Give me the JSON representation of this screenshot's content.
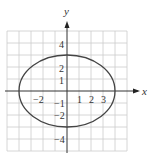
{
  "diagram": {
    "type": "ellipse-on-grid",
    "equation_shape": "ellipse centered at origin, horizontal semi-axis 4, vertical semi-axis 3",
    "x_axis_label": "x",
    "y_axis_label": "y",
    "x_ticks": [
      {
        "value": -2,
        "label": "−2"
      },
      {
        "value": 1,
        "label": "1"
      },
      {
        "value": 2,
        "label": "2"
      },
      {
        "value": 3,
        "label": "3"
      }
    ],
    "y_ticks": [
      {
        "value": 4,
        "label": "4"
      },
      {
        "value": 2,
        "label": "2"
      },
      {
        "value": 1,
        "label": "1"
      },
      {
        "value": -1,
        "label": "−1"
      },
      {
        "value": -2,
        "label": "−2"
      },
      {
        "value": -4,
        "label": "−4"
      }
    ],
    "grid_range": {
      "x": [
        -5,
        5
      ],
      "y": [
        -5,
        5
      ]
    },
    "ellipse": {
      "cx": 0,
      "cy": 0,
      "rx": 4,
      "ry": 3
    },
    "colors": {
      "grid": "#c8c8c8",
      "axis": "#333333",
      "curve": "#444444"
    }
  }
}
